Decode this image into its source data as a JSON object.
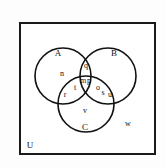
{
  "figure": {
    "name": "venn-diagram-three-sets",
    "universe_label": "U",
    "outside_label": "w",
    "border_color": "#1a1a1a",
    "circle_color": "#111111",
    "background": "#ffffff"
  },
  "sets": [
    {
      "id": "A",
      "label": "A",
      "label_x": 58,
      "label_y": 53,
      "cx": 63,
      "cy": 76,
      "r": 28
    },
    {
      "id": "B",
      "label": "B",
      "label_x": 114,
      "label_y": 53,
      "cx": 108,
      "cy": 76,
      "r": 28
    },
    {
      "id": "C",
      "label": "C",
      "label_x": 85,
      "label_y": 127,
      "cx": 86,
      "cy": 104,
      "r": 28
    }
  ],
  "elements": [
    {
      "label": "A",
      "region": "set-A-name",
      "x": 58,
      "y": 53
    },
    {
      "label": "B",
      "region": "set-B-name",
      "x": 114,
      "y": 53
    },
    {
      "label": "C",
      "region": "set-C-name",
      "x": 85,
      "y": 127
    },
    {
      "label": "q",
      "region": "A-and-B-only",
      "x": 86,
      "y": 66
    },
    {
      "label": "n",
      "region": "A-only",
      "x": 62,
      "y": 74
    },
    {
      "label": "m",
      "region": "A-and-B-and-C",
      "x": 83,
      "y": 81
    },
    {
      "label": "p",
      "region": "A-and-B-and-C",
      "x": 89,
      "y": 81
    },
    {
      "label": "t",
      "region": "A-and-C-only",
      "x": 75,
      "y": 88
    },
    {
      "label": "r",
      "region": "A-and-C-only",
      "x": 65,
      "y": 95
    },
    {
      "label": "o",
      "region": "B-and-C-only",
      "x": 98,
      "y": 88
    },
    {
      "label": "s",
      "region": "B-and-C-only",
      "x": 103,
      "y": 93
    },
    {
      "label": "u",
      "region": "B-and-C-only",
      "x": 110,
      "y": 95
    },
    {
      "label": "v",
      "region": "C-only",
      "x": 85,
      "y": 111
    },
    {
      "label": "w",
      "region": "outside-all-sets",
      "x": 128,
      "y": 124
    },
    {
      "label": "U",
      "region": "universal-set",
      "x": 30,
      "y": 145
    }
  ]
}
